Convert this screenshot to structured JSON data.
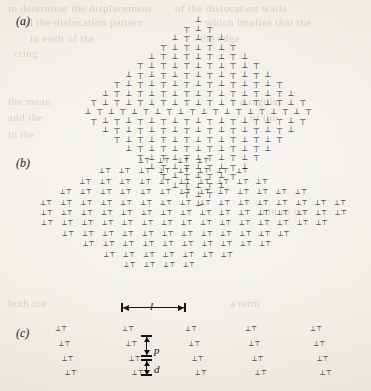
{
  "figure": {
    "type": "dislocation-arrangement-diagram",
    "background_color": "#ece7df",
    "ink_color": "#111111",
    "width": 371,
    "height": 391
  },
  "panels": [
    {
      "id": "a",
      "label": "(a)",
      "label_x": 16,
      "label_y": 18,
      "shape": "rhombus",
      "description": "Dense rhombus of alternating edge-dislocation symbols",
      "symbol_set": [
        "⊥",
        "⊤"
      ],
      "glyph_font_size": 8,
      "origin_x": 195,
      "origin_y": 16,
      "row_step": 9.2,
      "col_step": 11.6,
      "row_shift": 2.6,
      "rows": [
        1,
        3,
        5,
        7,
        9,
        11,
        13,
        15,
        17,
        19,
        20,
        19,
        17,
        15,
        13,
        11,
        9,
        7,
        5,
        3,
        1
      ]
    },
    {
      "id": "b",
      "label": "(b)",
      "label_x": 16,
      "label_y": 160,
      "shape": "lens",
      "description": "Lens-shaped assembly of dislocation dipole pairs in vertical columns",
      "symbol_set": [
        "⊥⊤"
      ],
      "glyph_font_size": 7,
      "origin_x": 40,
      "origin_y": 158,
      "col_step": 19.6,
      "row_step": 10.4,
      "columns": [
        {
          "x_index": 0,
          "count": 3,
          "top_index": 4
        },
        {
          "x_index": 1,
          "count": 5,
          "top_index": 3
        },
        {
          "x_index": 2,
          "count": 7,
          "top_index": 2
        },
        {
          "x_index": 3,
          "count": 9,
          "top_index": 1
        },
        {
          "x_index": 4,
          "count": 10,
          "top_index": 1
        },
        {
          "x_index": 5,
          "count": 11,
          "top_index": 0
        },
        {
          "x_index": 6,
          "count": 11,
          "top_index": 0
        },
        {
          "x_index": 7,
          "count": 11,
          "top_index": 0
        },
        {
          "x_index": 8,
          "count": 10,
          "top_index": 0
        },
        {
          "x_index": 9,
          "count": 9,
          "top_index": 1
        },
        {
          "x_index": 10,
          "count": 8,
          "top_index": 1
        },
        {
          "x_index": 11,
          "count": 7,
          "top_index": 2
        },
        {
          "x_index": 12,
          "count": 5,
          "top_index": 3
        },
        {
          "x_index": 13,
          "count": 4,
          "top_index": 3
        },
        {
          "x_index": 14,
          "count": 3,
          "top_index": 4
        },
        {
          "x_index": 15,
          "count": 2,
          "top_index": 4
        }
      ]
    },
    {
      "id": "c",
      "label": "(c)",
      "label_x": 16,
      "label_y": 330,
      "shape": "regular-lattice",
      "description": "Regular periodic array of dislocation dipoles with spacing annotations",
      "symbol_set": [
        "⊥⊤"
      ],
      "glyph_font_size": 7,
      "column_x": [
        55,
        122,
        185,
        245,
        310
      ],
      "row_y": [
        326,
        341,
        356,
        370
      ],
      "row_shift": 3.2
    }
  ],
  "annotations": {
    "length_l": {
      "symbol": "l",
      "meaning": "horizontal wall spacing",
      "x_start": 122,
      "x_end": 185,
      "y": 307,
      "label_x": 150,
      "label_y": 300
    },
    "length_p": {
      "symbol": "p",
      "meaning": "vertical dipole spacing along wall",
      "x": 146,
      "y_start": 336,
      "y_end": 356,
      "label_x": 154,
      "label_y": 344
    },
    "length_d": {
      "symbol": "d",
      "meaning": "dipole separation",
      "x": 146,
      "y_start": 360,
      "y_end": 375,
      "label_x": 154,
      "label_y": 363
    }
  },
  "bleed_through_lines": [
    {
      "text": "to determine the displacement",
      "x": 8,
      "y": 2,
      "size": 11
    },
    {
      "text": "ed the dislocation pattern",
      "x": 22,
      "y": 16,
      "size": 11
    },
    {
      "text": "of the dislocation walls",
      "x": 175,
      "y": 2,
      "size": 11
    },
    {
      "text": "which implies that the",
      "x": 205,
      "y": 16,
      "size": 11
    },
    {
      "text": "in each of the",
      "x": 30,
      "y": 32,
      "size": 11
    },
    {
      "text": "the edge",
      "x": 200,
      "y": 32,
      "size": 11
    },
    {
      "text": "cting",
      "x": 14,
      "y": 47,
      "size": 11
    },
    {
      "text": "the mean",
      "x": 8,
      "y": 95,
      "size": 11
    },
    {
      "text": "and the",
      "x": 8,
      "y": 111,
      "size": 11
    },
    {
      "text": "in the",
      "x": 8,
      "y": 128,
      "size": 11
    },
    {
      "text": "a regular",
      "x": 240,
      "y": 95,
      "size": 11
    },
    {
      "text": "of the",
      "x": 250,
      "y": 111,
      "size": 11
    },
    {
      "text": "both the",
      "x": 8,
      "y": 297,
      "size": 11
    },
    {
      "text": "a term",
      "x": 230,
      "y": 297,
      "size": 11
    },
    {
      "text": "and so on",
      "x": 260,
      "y": 205,
      "size": 11
    }
  ]
}
